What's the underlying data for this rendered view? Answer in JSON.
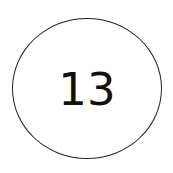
{
  "badge": {
    "value": "13",
    "border_color": "#222222",
    "text_color": "#111111",
    "background": "#ffffff"
  }
}
